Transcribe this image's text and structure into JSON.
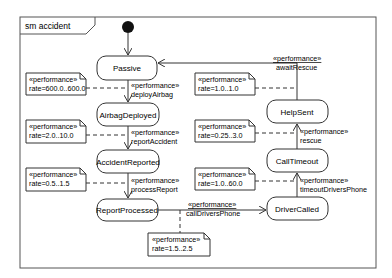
{
  "frame": {
    "title": "sm accident"
  },
  "states": [
    {
      "id": "passive",
      "label": "Passive"
    },
    {
      "id": "airbag_deployed",
      "label": "AirbagDeployed"
    },
    {
      "id": "accident_reported",
      "label": "AccidentReported"
    },
    {
      "id": "report_processed",
      "label": "ReportProcessed"
    },
    {
      "id": "driver_called",
      "label": "DriverCalled"
    },
    {
      "id": "call_timeout",
      "label": "CallTimeout"
    },
    {
      "id": "help_sent",
      "label": "HelpSent"
    }
  ],
  "transitions": [
    {
      "stereotype": "«performance»",
      "name": "deployAirbag",
      "from": "Passive",
      "to": "AirbagDeployed"
    },
    {
      "stereotype": "«performance»",
      "name": "reportAccident",
      "from": "AirbagDeployed",
      "to": "AccidentReported"
    },
    {
      "stereotype": "«performance»",
      "name": "processReport",
      "from": "AccidentReported",
      "to": "ReportProcessed"
    },
    {
      "stereotype": "«performance»",
      "name": "callDriversPhone",
      "from": "ReportProcessed",
      "to": "DriverCalled"
    },
    {
      "stereotype": "«performance»",
      "name": "timeoutDriversPhone",
      "from": "DriverCalled",
      "to": "CallTimeout"
    },
    {
      "stereotype": "«performance»",
      "name": "rescue",
      "from": "CallTimeout",
      "to": "HelpSent"
    },
    {
      "stereotype": "«performance»",
      "name": "awaitRescue",
      "from": "HelpSent",
      "to": "Passive"
    }
  ],
  "notes": [
    {
      "stereotype": "«performance»",
      "rate": "rate=600.0..600.0"
    },
    {
      "stereotype": "«performance»",
      "rate": "rate=2.0..10.0"
    },
    {
      "stereotype": "«performance»",
      "rate": "rate=0.5..1.5"
    },
    {
      "stereotype": "«performance»",
      "rate": "rate=1.5..2.5"
    },
    {
      "stereotype": "«performance»",
      "rate": "rate=1.0..60.0"
    },
    {
      "stereotype": "«performance»",
      "rate": "rate=0.25..3.0"
    },
    {
      "stereotype": "«performance»",
      "rate": "rate=1.0..1.0"
    }
  ],
  "colors": {
    "line": "#333333",
    "fill": "#ffffff",
    "initial": "#111111"
  }
}
